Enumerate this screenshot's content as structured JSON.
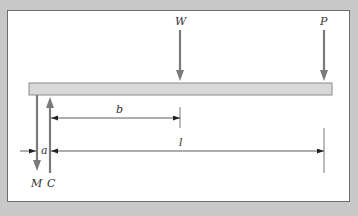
{
  "diagram": {
    "type": "cantilever-beam-loading",
    "labels": {
      "load_w": "W",
      "load_p": "P",
      "dim_b": "b",
      "dim_l": "l",
      "dim_a": "a",
      "reaction_m": "M",
      "reaction_c": "C"
    },
    "colors": {
      "background": "#c8c8c8",
      "panel": "#ffffff",
      "beam_fill": "#d9d9d9",
      "beam_stroke": "#8a8a8a",
      "arrow": "#7a7a7a",
      "dimension_line": "#333333"
    }
  }
}
